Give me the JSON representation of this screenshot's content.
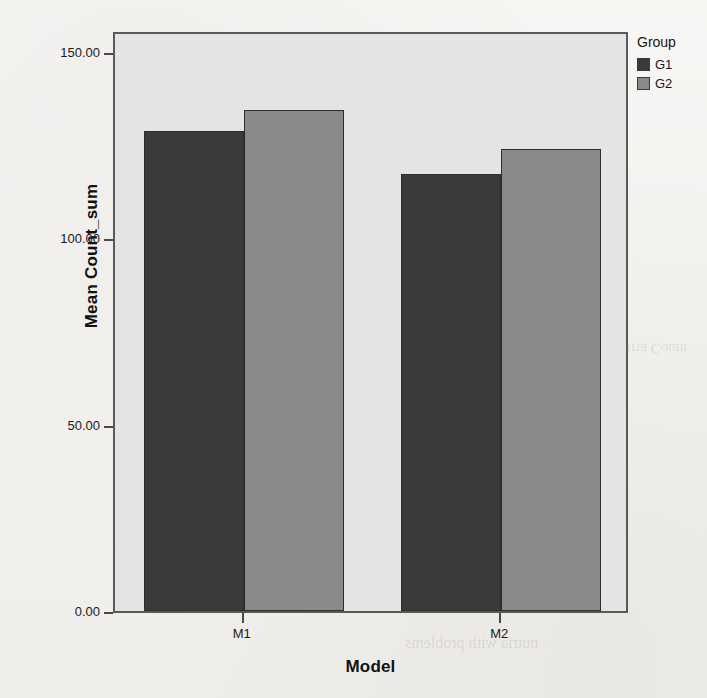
{
  "chart_data": {
    "type": "bar",
    "title": "",
    "subtitle": "",
    "xlabel": "Model",
    "ylabel": "Mean Count_sum",
    "categories": [
      "M1",
      "M2"
    ],
    "series": [
      {
        "name": "G1",
        "values": [
          128.8,
          117.2
        ],
        "color": "#3a3a3a"
      },
      {
        "name": "G2",
        "values": [
          134.4,
          124.0
        ],
        "color": "#8a8a8a"
      }
    ],
    "legend": {
      "title": "Group",
      "position": "right",
      "entries": [
        "G1",
        "G2"
      ]
    },
    "ylim": [
      0,
      150
    ],
    "yticks": [
      0,
      50,
      100,
      150
    ],
    "ytick_labels": [
      "0.00",
      "50.00",
      "100.00",
      "150.00"
    ],
    "xtick_labels": [
      "M1",
      "M2"
    ],
    "grid": false,
    "plot_background": "#e4e4e2",
    "frame_color": "#595959",
    "page_background": "#f5f4f2",
    "bar_outline": "#2e2e2e"
  },
  "bleed_through": {
    "right_mid": "nutria Count",
    "bottom": "nutria with problems"
  }
}
